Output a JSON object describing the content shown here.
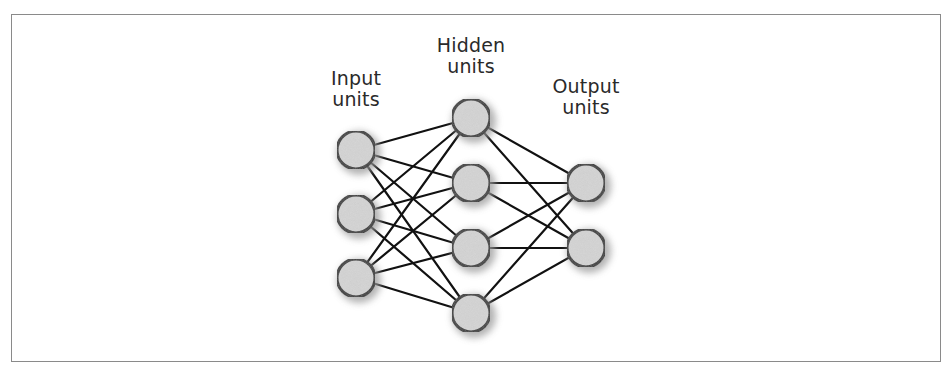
{
  "diagram": {
    "type": "neural-network",
    "layers": [
      {
        "name": "input",
        "label_line1": "Input",
        "label_line2": "units",
        "x": 356,
        "nodes_y": [
          150,
          214,
          278
        ],
        "label_x": 356,
        "label_y": 68
      },
      {
        "name": "hidden",
        "label_line1": "Hidden",
        "label_line2": "units",
        "x": 471,
        "nodes_y": [
          118,
          183,
          248,
          313
        ],
        "label_x": 471,
        "label_y": 35
      },
      {
        "name": "output",
        "label_line1": "Output",
        "label_line2": "units",
        "x": 586,
        "nodes_y": [
          183,
          248
        ],
        "label_x": 586,
        "label_y": 76
      }
    ],
    "connections": "fully-connected between adjacent layers",
    "node_radius": 19,
    "colors": {
      "node_fill": "#d4d4d4",
      "node_stroke": "#3a3a3a",
      "edge": "#111111",
      "shadow": "#9a9a9a",
      "frame_border": "#8a8a8a",
      "text": "#2a2a2a"
    }
  }
}
